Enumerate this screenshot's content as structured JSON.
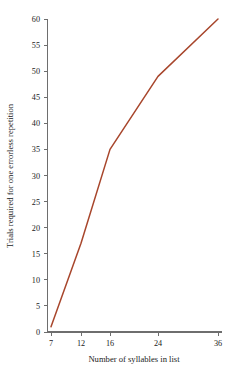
{
  "chart_data": {
    "type": "line",
    "title": "",
    "subtitle": "",
    "xlabel": "Number of syllables in list",
    "ylabel": "Trials required for one errorless repetition",
    "x": [
      7,
      12,
      16,
      24,
      36
    ],
    "values": [
      1,
      17,
      35,
      49,
      60
    ],
    "series": [
      {
        "name": "Trials required for one errorless repetition",
        "values": [
          1,
          17,
          35,
          49,
          60
        ],
        "color": "#a8462c"
      }
    ],
    "categories": [
      "7",
      "12",
      "16",
      "24",
      "36"
    ],
    "xtick_labels": [
      "7",
      "12",
      "16",
      "24",
      "36"
    ],
    "ytick_labels": [
      "0",
      "5",
      "10",
      "15",
      "20",
      "25",
      "30",
      "35",
      "40",
      "45",
      "50",
      "55",
      "60"
    ],
    "ytick_values": [
      0,
      5,
      10,
      15,
      20,
      25,
      30,
      35,
      40,
      45,
      50,
      55,
      60
    ],
    "ylim": [
      0,
      60
    ],
    "xlim": [
      7,
      36
    ],
    "x_axis_scale": "ordinal-spaced",
    "grid": false,
    "legend": "none",
    "line_color": "#a8462c",
    "axis_color": "#6e6e6e",
    "background_color": "#ffffff",
    "markers": false,
    "annotations": []
  }
}
